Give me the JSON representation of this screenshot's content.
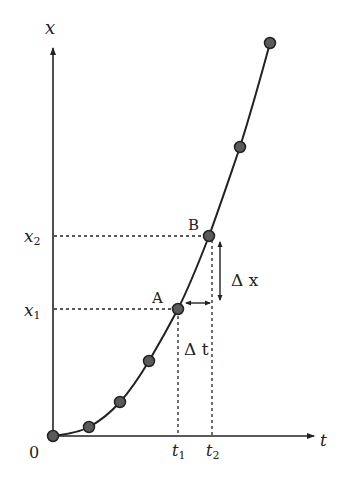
{
  "diagram": {
    "type": "position-time graph",
    "axes": {
      "x_axis_label": "t",
      "y_axis_label": "x",
      "origin_label": "0"
    },
    "points": [
      {
        "px": 53,
        "py": 436
      },
      {
        "px": 89,
        "py": 427
      },
      {
        "px": 120,
        "py": 402
      },
      {
        "px": 149,
        "py": 361
      },
      {
        "px": 178,
        "py": 309
      },
      {
        "px": 209,
        "py": 236
      },
      {
        "px": 240,
        "py": 147
      },
      {
        "px": 270,
        "py": 43
      }
    ],
    "labels": {
      "point_a": "A",
      "point_b": "B",
      "x1": "x",
      "x1_sub": "1",
      "x2": "x",
      "x2_sub": "2",
      "t1": "t",
      "t1_sub": "1",
      "t2": "t",
      "t2_sub": "2",
      "delta_x": "Δ x",
      "delta_t": "Δ t"
    },
    "colors": {
      "line": "#222222",
      "point_fill": "#5a5a5a",
      "background": "#ffffff"
    }
  }
}
